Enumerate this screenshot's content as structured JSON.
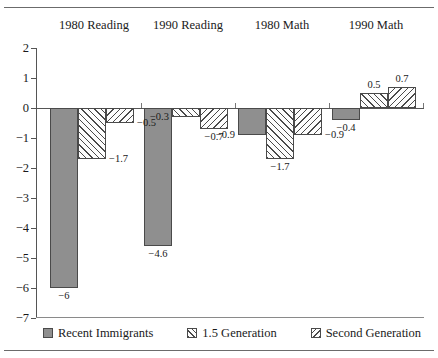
{
  "chart_data": {
    "type": "bar",
    "title": "",
    "subtitle": "",
    "xlabel": "",
    "ylabel": "",
    "categories": [
      "1980 Reading",
      "1990 Reading",
      "1980 Math",
      "1990 Math"
    ],
    "series": [
      {
        "name": "Recent Immigrants",
        "pattern": "solid-gray",
        "color": "#8f8f8f",
        "values": [
          -6,
          -4.6,
          -0.9,
          -0.4
        ],
        "labels": [
          "−6",
          "−4.6",
          "−0.9",
          "−0.4"
        ]
      },
      {
        "name": "1.5 Generation",
        "pattern": "forward-hatch",
        "color": "#fdfdfd",
        "values": [
          -1.7,
          -0.3,
          -1.7,
          0.5
        ],
        "labels": [
          "−1.7",
          "−0.3",
          "−1.7",
          "0.5"
        ]
      },
      {
        "name": "Second Generation",
        "pattern": "back-hatch",
        "color": "#fdfdfd",
        "values": [
          -0.5,
          -0.7,
          -0.9,
          0.7
        ],
        "labels": [
          "−0.5",
          "−0.7",
          "−0.9",
          "0.7"
        ]
      }
    ],
    "ylim": [
      -7,
      2
    ],
    "yticks": [
      2,
      1,
      0,
      -1,
      -2,
      -3,
      -4,
      -5,
      -6,
      -7
    ],
    "ytick_labels": [
      "2",
      "1",
      "0",
      "−1",
      "−2",
      "−3",
      "−4",
      "−5",
      "−6",
      "−7"
    ],
    "grid": false,
    "legend_position": "bottom",
    "category_labels_position": "top",
    "zero_line": true
  },
  "legend": {
    "items": [
      {
        "label": "Recent Immigrants",
        "swatch": "solid"
      },
      {
        "label": "1.5 Generation",
        "swatch": "hatch-f"
      },
      {
        "label": "Second Generation",
        "swatch": "hatch-b"
      }
    ]
  }
}
